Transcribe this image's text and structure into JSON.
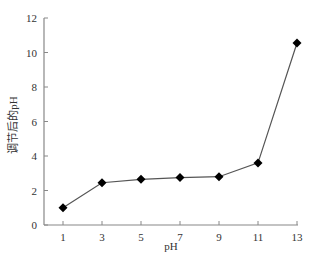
{
  "chart_data": {
    "type": "line",
    "title": "",
    "xlabel": "pH",
    "ylabel": "调节后的pH",
    "x": [
      1,
      3,
      5,
      7,
      9,
      11,
      13
    ],
    "series": [
      {
        "name": "调节后的pH",
        "values": [
          1.0,
          2.45,
          2.65,
          2.75,
          2.8,
          3.6,
          10.55
        ],
        "marker": "diamond",
        "color": "#000000",
        "line_color": "#555555"
      }
    ],
    "xticks": [
      "1",
      "3",
      "5",
      "7",
      "9",
      "11",
      "13"
    ],
    "yticks": [
      "0",
      "2",
      "4",
      "6",
      "8",
      "10",
      "12"
    ],
    "xlim": [
      0,
      13
    ],
    "ylim": [
      0,
      12
    ],
    "grid": false,
    "legend": "none"
  }
}
